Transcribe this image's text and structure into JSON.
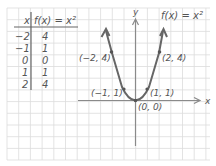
{
  "table": {
    "header_x": "x",
    "header_fx": "f(x) = x²",
    "rows": [
      {
        "x": "−2",
        "y": "4"
      },
      {
        "x": "−1",
        "y": "1"
      },
      {
        "x": "0",
        "y": "0"
      },
      {
        "x": "1",
        "y": "1"
      },
      {
        "x": "2",
        "y": "4"
      }
    ]
  },
  "graph": {
    "function_label": "f(x) = x²",
    "x_axis_label": "x",
    "y_axis_label": "y",
    "points": [
      {
        "label": "(−2, 4)"
      },
      {
        "label": "(2, 4)"
      },
      {
        "label": "(−1, 1)"
      },
      {
        "label": "(1, 1)"
      },
      {
        "label": "(0, 0)"
      }
    ]
  },
  "colors": {
    "grid": "#d9d9d9",
    "curve": "#666666",
    "axis": "#8a8a8a",
    "text": "#555555"
  }
}
